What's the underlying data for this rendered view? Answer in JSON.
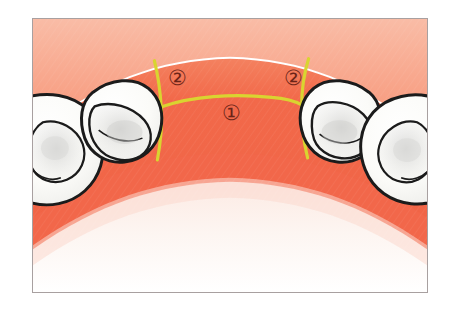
{
  "figure": {
    "frame": {
      "border_color": "#a8a0a0",
      "background_color": "#ffffff"
    }
  },
  "palette": {
    "gingiva_light": "#f8b39a",
    "gingiva_mid": "#f58f72",
    "gingiva_deep": "#f4704f",
    "gingiva_band": "#f26a4a",
    "gingiva_pale": "#fdf3ef",
    "tooth_fill": "#fdfdfb",
    "tooth_outline": "#1b1b1b",
    "tooth_shade": "#bdbdbd",
    "incision_line": "#d9d430",
    "marker_text": "#6b2418",
    "frame_border": "#a8a0a0",
    "page_background": "#ffffff"
  },
  "markers": [
    {
      "id": "marker-1",
      "label": "①",
      "number": "1",
      "meaning": "crestal incision",
      "x": 232,
      "y": 109
    },
    {
      "id": "marker-2-left",
      "label": "②",
      "number": "2",
      "meaning": "vertical releasing incision (left)",
      "x": 177,
      "y": 73
    },
    {
      "id": "marker-2-right",
      "label": "②",
      "number": "2",
      "meaning": "vertical releasing incision (right)",
      "x": 296,
      "y": 73
    }
  ],
  "incisions": [
    {
      "id": "crestal-incision",
      "name": "crestal incision",
      "marker": "①"
    },
    {
      "id": "releasing-incision-left",
      "name": "left vertical releasing incision",
      "marker": "②"
    },
    {
      "id": "releasing-incision-right",
      "name": "right vertical releasing incision",
      "marker": "②"
    }
  ],
  "teeth": [
    {
      "id": "tooth-left-outer",
      "side": "left",
      "position": "outer"
    },
    {
      "id": "tooth-left-inner",
      "side": "left",
      "position": "inner"
    },
    {
      "id": "tooth-right-inner",
      "side": "right",
      "position": "inner"
    },
    {
      "id": "tooth-right-outer",
      "side": "right",
      "position": "outer"
    }
  ]
}
